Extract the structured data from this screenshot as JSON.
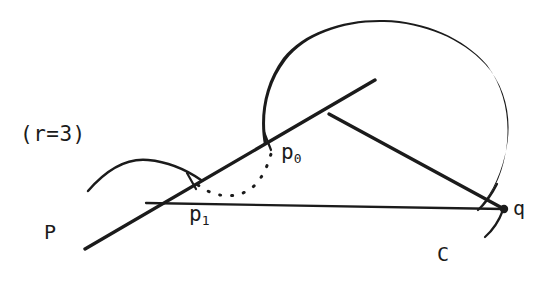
{
  "figure": {
    "background_color": "#ffffff",
    "ink_color": "#1b1b1b",
    "width": 543,
    "height": 282
  },
  "labels": {
    "radius_note": "(r=3)",
    "point_p0": "p",
    "point_p0_sub": "0",
    "point_p1": "p",
    "point_p1_sub": "1",
    "ray_P": "P",
    "point_q": "q",
    "curve_C": "C"
  },
  "geometry": {
    "circle_C": {
      "name": "large-circle-C",
      "cx": 386,
      "cy": 131,
      "rx": 124,
      "ry": 108,
      "description": "large circle through q, open near lower-left at p0"
    },
    "small_arc": {
      "name": "small-arc-left",
      "start": [
        88,
        191
      ],
      "control": [
        140,
        158
      ],
      "end": [
        200,
        179
      ],
      "description": "small hand-drawn arc crossing the ray near p1"
    },
    "ray_P": {
      "name": "ray-from-P",
      "start": [
        85,
        249
      ],
      "end": [
        375,
        80
      ],
      "description": "long straight ray from lower-left P to upper-right"
    },
    "segment_to_q": {
      "name": "segment-branch-to-q",
      "start": [
        330,
        113
      ],
      "end": [
        504,
        209
      ],
      "description": "straight segment from branch point on ray down to q"
    },
    "baseline": {
      "name": "baseline-p1-to-q",
      "start": [
        147,
        203
      ],
      "end": [
        504,
        209
      ],
      "description": "near-horizontal chord from the ray at p1 across to q"
    },
    "dotted_arc": {
      "name": "dotted-arc-p1-p0",
      "start": [
        196,
        184
      ],
      "control": [
        235,
        200
      ],
      "end": [
        272,
        156
      ],
      "description": "dotted arc sweeping from p1 to p0"
    },
    "points": [
      {
        "name": "point-p0",
        "x": 268,
        "y": 143,
        "marker": "tick"
      },
      {
        "name": "point-p1",
        "x": 192,
        "y": 182,
        "marker": "tick"
      },
      {
        "name": "point-q",
        "x": 504,
        "y": 209,
        "marker": "dot"
      }
    ]
  }
}
